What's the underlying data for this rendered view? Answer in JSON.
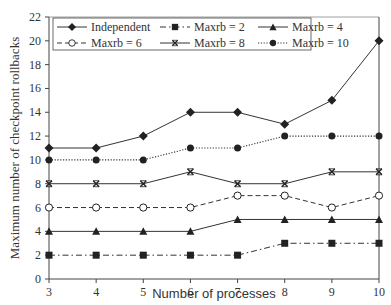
{
  "chart_data": {
    "type": "line",
    "title": "",
    "xlabel": "Number of processes",
    "ylabel": "Maximum number of checkpoint rollbacks",
    "x": [
      3,
      4,
      5,
      6,
      7,
      8,
      9,
      10
    ],
    "xlim": [
      3,
      10
    ],
    "ylim": [
      0,
      22
    ],
    "yticks": [
      0,
      2,
      4,
      6,
      8,
      10,
      12,
      14,
      16,
      18,
      20,
      22
    ],
    "xticks": [
      3,
      4,
      5,
      6,
      7,
      8,
      9,
      10
    ],
    "grid": false,
    "legend_position": "top, inside plot, 3 columns",
    "series": [
      {
        "name": "Independent",
        "marker": "diamond-filled",
        "line": "solid",
        "values": [
          11,
          11,
          12,
          14,
          14,
          13,
          15,
          20
        ]
      },
      {
        "name": "Maxrb = 2",
        "marker": "square-filled",
        "line": "dashdot",
        "values": [
          2,
          2,
          2,
          2,
          2,
          3,
          3,
          3
        ]
      },
      {
        "name": "Maxrb = 4",
        "marker": "triangle-filled",
        "line": "solid",
        "values": [
          4,
          4,
          4,
          4,
          5,
          5,
          5,
          5
        ]
      },
      {
        "name": "Maxrb = 6",
        "marker": "circle-open",
        "line": "dashed",
        "values": [
          6,
          6,
          6,
          6,
          7,
          7,
          6,
          7
        ]
      },
      {
        "name": "Maxrb = 8",
        "marker": "x-cross",
        "line": "solid",
        "values": [
          8,
          8,
          8,
          9,
          8,
          8,
          9,
          9
        ]
      },
      {
        "name": "Maxrb = 10",
        "marker": "circle-filled",
        "line": "dotted",
        "values": [
          10,
          10,
          10,
          11,
          11,
          12,
          12,
          12
        ]
      }
    ]
  },
  "axes": {
    "x_title": "Number of processes",
    "y_title": "Maximum number of  checkpoint rollbacks",
    "x_tick_labels": [
      "3",
      "4",
      "5",
      "6",
      "7",
      "8",
      "9",
      "10"
    ],
    "y_tick_labels": [
      "0",
      "2",
      "4",
      "6",
      "8",
      "10",
      "12",
      "14",
      "16",
      "18",
      "20",
      "22"
    ]
  },
  "legend": {
    "items": [
      {
        "label": "Independent"
      },
      {
        "label": "Maxrb = 2"
      },
      {
        "label": "Maxrb = 4"
      },
      {
        "label": "Maxrb = 6"
      },
      {
        "label": "Maxrb = 8"
      },
      {
        "label": "Maxrb = 10"
      }
    ]
  },
  "colors": {
    "line": "#222222",
    "axis": "#444444",
    "background": "#ffffff"
  }
}
